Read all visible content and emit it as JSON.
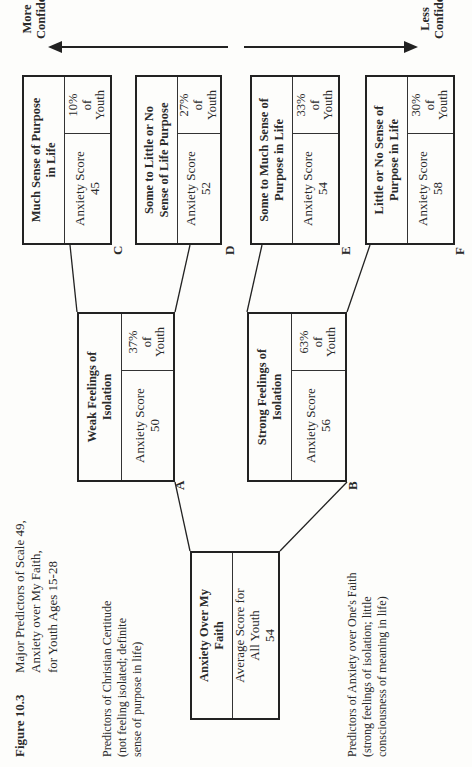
{
  "figure": {
    "number_label": "Figure 10.3",
    "title_lines": [
      "Major Predictors of Scale 49,",
      "Anxiety over My Faith,",
      "for Youth Ages 15-28"
    ]
  },
  "axis": {
    "left_label_lines": [
      "More",
      "Confident"
    ],
    "right_label_lines": [
      "Less",
      "Confident"
    ]
  },
  "legend": {
    "top": {
      "lines": [
        "Predictors of Christian Certitude",
        "(not feeling isolated; definite",
        "sense of purpose in life)"
      ]
    },
    "bottom": {
      "lines": [
        "Predictors of Anxiety over One's Faith",
        "(strong feelings of isolation; little",
        "consciousness of meaning in life)"
      ]
    }
  },
  "root": {
    "title_lines": [
      "Anxiety Over My",
      "Faith"
    ],
    "score_lines": [
      "Average Score for",
      "All Youth",
      "54"
    ]
  },
  "nodes": {
    "A": {
      "letter": "A",
      "title_lines": [
        "Weak Feelings of",
        "Isolation"
      ],
      "score_label": "Anxiety Score",
      "score": "50",
      "pct": "37%",
      "pct_of": "of",
      "pct_group": "Youth"
    },
    "B": {
      "letter": "B",
      "title_lines": [
        "Strong Feelings of",
        "Isolation"
      ],
      "score_label": "Anxiety Score",
      "score": "56",
      "pct": "63%",
      "pct_of": "of",
      "pct_group": "Youth"
    },
    "C": {
      "letter": "C",
      "title_lines": [
        "Much Sense of Purpose",
        "in Life"
      ],
      "score_label": "Anxiety Score",
      "score": "45",
      "pct": "10%",
      "pct_of": "of",
      "pct_group": "Youth"
    },
    "D": {
      "letter": "D",
      "title_lines": [
        "Some to Little or No",
        "Sense of Life Purpose"
      ],
      "score_label": "Anxiety Score",
      "score": "52",
      "pct": "27%",
      "pct_of": "of",
      "pct_group": "Youth"
    },
    "E": {
      "letter": "E",
      "title_lines": [
        "Some to Much Sense of",
        "Purpose in Life"
      ],
      "score_label": "Anxiety Score",
      "score": "54",
      "pct": "33%",
      "pct_of": "of",
      "pct_group": "Youth"
    },
    "F": {
      "letter": "F",
      "title_lines": [
        "Little or No Sense of",
        "Purpose in Life"
      ],
      "score_label": "Anxiety Score",
      "score": "58",
      "pct": "30%",
      "pct_of": "of",
      "pct_group": "Youth"
    }
  },
  "colors": {
    "ink": "#222222",
    "paper": "#fdfdfb"
  }
}
